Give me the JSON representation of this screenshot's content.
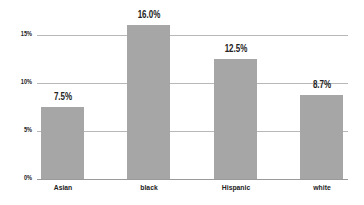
{
  "chart_data": {
    "type": "bar",
    "title": "",
    "xlabel": "",
    "ylabel": "",
    "categories": [
      "Asian",
      "black",
      "Hispanic",
      "white"
    ],
    "values": [
      7.5,
      16.0,
      12.5,
      8.7
    ],
    "value_labels": [
      "7.5%",
      "16.0%",
      "12.5%",
      "8.7%"
    ],
    "yticks": [
      "0%",
      "5%",
      "10%",
      "15%"
    ],
    "ylim": [
      0,
      16
    ],
    "grid": true,
    "bar_color": "#a6a6a6"
  }
}
